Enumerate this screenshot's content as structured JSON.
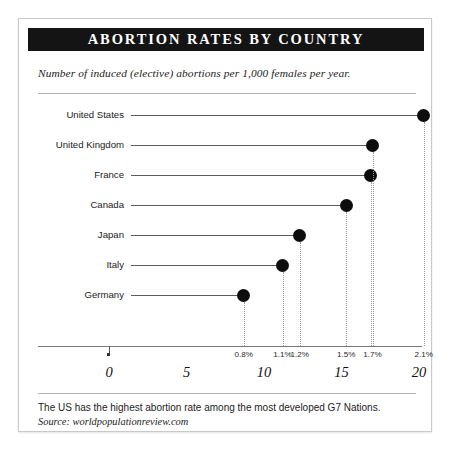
{
  "card": {
    "title": "ABORTION RATES BY COUNTRY",
    "subtitle": "Number of induced (elective) abortions per 1,000 females per year.",
    "footer_note": "The US has the highest abortion rate among the most developed G7 Nations.",
    "footer_source": "Source: worldpopulationreview.com"
  },
  "colors": {
    "title_bar": "#141414",
    "dot": "#0d0d0d",
    "stem": "#5c5c5c",
    "rule": "#b3b3b3",
    "axis": "#777777",
    "dropline": "#9a9a9a",
    "card_border": "#c9c9c9",
    "background": "#ffffff"
  },
  "chart_data": {
    "type": "bar",
    "title": "ABORTION RATES BY COUNTRY",
    "subtitle": "Number of induced (elective) abortions per 1,000 females per year.",
    "xlabel": "",
    "ylabel": "",
    "xlim": [
      0,
      21
    ],
    "grid": false,
    "legend": "none",
    "orientation": "horizontal",
    "categories": [
      "United States",
      "United Kingdom",
      "France",
      "Canada",
      "Japan",
      "Italy",
      "Germany"
    ],
    "values": [
      20.3,
      17.0,
      16.9,
      15.3,
      12.3,
      11.2,
      8.7
    ],
    "point_labels": [
      "2.1%",
      "1.7%",
      "1.7%",
      "1.5%",
      "1.2%",
      "1.1%",
      "0.8%"
    ],
    "tick_values": [
      0,
      5,
      10,
      15,
      20
    ],
    "tick_labels": [
      "0",
      "5",
      "10",
      "15",
      "20"
    ],
    "percent_axis_labels": [
      "0.8%",
      "1.1%",
      "1.2%",
      "1.5%",
      "1.7%",
      "2.1%"
    ],
    "percent_axis_values": [
      8.7,
      11.2,
      12.3,
      15.3,
      17.0,
      20.3
    ]
  },
  "rows": [
    {
      "label": "United States",
      "value": 20.3,
      "pct": "2.1%"
    },
    {
      "label": "United Kingdom",
      "value": 17.0,
      "pct": "1.7%"
    },
    {
      "label": "France",
      "value": 16.9,
      "pct": "1.7%"
    },
    {
      "label": "Canada",
      "value": 15.3,
      "pct": "1.5%"
    },
    {
      "label": "Japan",
      "value": 12.3,
      "pct": "1.2%"
    },
    {
      "label": "Italy",
      "value": 11.2,
      "pct": "1.1%"
    },
    {
      "label": "Germany",
      "value": 8.7,
      "pct": "0.8%"
    }
  ],
  "ticks": [
    {
      "label": "0",
      "value": 0
    },
    {
      "label": "5",
      "value": 5
    },
    {
      "label": "10",
      "value": 10
    },
    {
      "label": "15",
      "value": 15
    },
    {
      "label": "20",
      "value": 20
    }
  ],
  "pct_axis": [
    {
      "label": "0.8%",
      "value": 8.7
    },
    {
      "label": "1.1%",
      "value": 11.2
    },
    {
      "label": "1.2%",
      "value": 12.3
    },
    {
      "label": "1.5%",
      "value": 15.3
    },
    {
      "label": "1.7%",
      "value": 17.0
    },
    {
      "label": "2.1%",
      "value": 20.3
    }
  ]
}
